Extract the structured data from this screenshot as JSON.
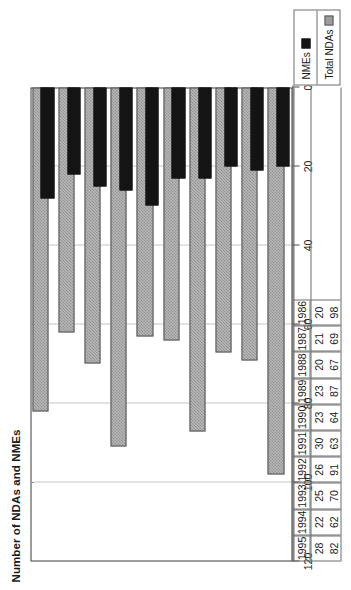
{
  "chart_data": {
    "type": "bar",
    "title": "Number of NDAs and NMEs",
    "xlabel": "",
    "ylabel": "",
    "orientation": "horizontal-rotated",
    "grid": true,
    "legend_position": "bottom-right",
    "categories": [
      "1986",
      "1987",
      "1988",
      "1989",
      "1990",
      "1991",
      "1992",
      "1993",
      "1994",
      "1995"
    ],
    "axis_ticks": [
      "0",
      "20",
      "40",
      "60",
      "80",
      "100",
      "120"
    ],
    "axis_tick_values": [
      0,
      20,
      40,
      60,
      80,
      100,
      120
    ],
    "ylim": [
      0,
      120
    ],
    "series": [
      {
        "name": "NMEs",
        "color": "#141414",
        "values": [
          20,
          21,
          20,
          23,
          23,
          30,
          26,
          25,
          22,
          28
        ]
      },
      {
        "name": "Total NDAs",
        "color": "#b9b9b9",
        "values": [
          98,
          69,
          67,
          87,
          64,
          63,
          91,
          70,
          62,
          82
        ]
      }
    ]
  },
  "legend": {
    "items": [
      {
        "label": "NMEs",
        "swatch": "solid-black-swatch"
      },
      {
        "label": "Total NDAs",
        "swatch": "hatched-gray-swatch"
      }
    ]
  },
  "data_table": {
    "rows": [
      {
        "year": "1986",
        "nmes": "20",
        "total_ndas": "98"
      },
      {
        "year": "1987",
        "nmes": "21",
        "total_ndas": "69"
      },
      {
        "year": "1988",
        "nmes": "20",
        "total_ndas": "67"
      },
      {
        "year": "1989",
        "nmes": "23",
        "total_ndas": "87"
      },
      {
        "year": "1990",
        "nmes": "23",
        "total_ndas": "64"
      },
      {
        "year": "1991",
        "nmes": "30",
        "total_ndas": "63"
      },
      {
        "year": "1992",
        "nmes": "26",
        "total_ndas": "91"
      },
      {
        "year": "1993",
        "nmes": "25",
        "total_ndas": "70"
      },
      {
        "year": "1994",
        "nmes": "22",
        "total_ndas": "62"
      },
      {
        "year": "1995",
        "nmes": "28",
        "total_ndas": "82"
      }
    ]
  },
  "colors": {
    "nme_bar": "#141414",
    "total_bar": "#b9b9b9",
    "bar_border": "#4a4a4a",
    "gridline": "#8a8a8a",
    "axis": "#4a4a4a",
    "table_rule": "#6e6e6e",
    "background": "#ffffff"
  }
}
